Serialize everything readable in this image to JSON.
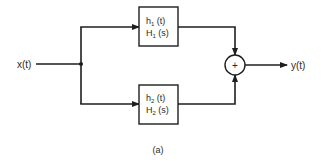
{
  "diagram": {
    "type": "block-diagram",
    "input": {
      "label": "x(t)"
    },
    "output": {
      "label": "y(t)"
    },
    "blocks": [
      {
        "id": "block1",
        "line1": {
          "base": "h",
          "sub": "1",
          "tail": " (t)"
        },
        "line2": {
          "base": "H",
          "sub": "1",
          "tail": " (s)"
        }
      },
      {
        "id": "block2",
        "line1": {
          "base": "h",
          "sub": "2",
          "tail": " (t)"
        },
        "line2": {
          "base": "H",
          "sub": "2",
          "tail": " (s)"
        }
      }
    ],
    "summer": {
      "symbol": "+"
    },
    "caption": "(a)",
    "colors": {
      "line": "#1e1e1e",
      "text": "#2a2a2a",
      "background": "#ffffff"
    }
  }
}
